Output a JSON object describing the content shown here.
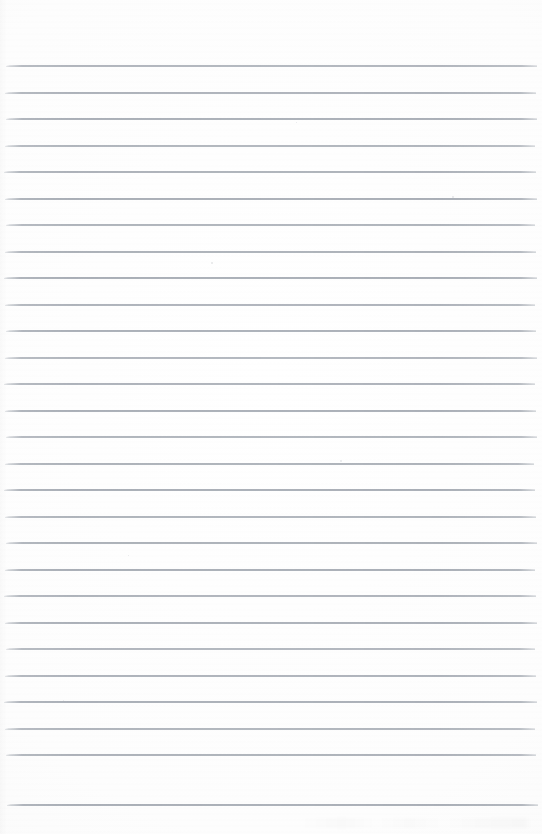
{
  "document": {
    "kind": "scanned-lined-notebook-page",
    "title": "Blank ruled notebook page",
    "page_width": 542,
    "page_height": 834,
    "content_text": "",
    "has_handwriting": false,
    "has_printed_text": false,
    "has_margin_line": false,
    "orientation": "portrait"
  },
  "colors": {
    "paper_background": "#fdfdfd",
    "page_edge": "#f7f7f8",
    "rule_line": "#a9aeb6",
    "rule_line_ghost": "#b0b5bd",
    "speck": "#969ba3"
  },
  "ruling": {
    "style": "wide-ruled horizontal lines",
    "line_count": 28,
    "first_line_y": 66,
    "line_spacing": 26.5,
    "line_thickness": 2,
    "line_start_x": 5,
    "line_end_x": 537,
    "top_margin": 66,
    "bottom_margin": 29,
    "lines_y": [
      66,
      92.5,
      119,
      145.5,
      172,
      198.5,
      225,
      251.5,
      278,
      304.5,
      331,
      357.5,
      384,
      410.5,
      437,
      463.5,
      490,
      516.5,
      543,
      569.5,
      596,
      622.5,
      649,
      675.5,
      702,
      728.5,
      755,
      805
    ],
    "lines_x_start": [
      6,
      5,
      6,
      5,
      4,
      5,
      6,
      5,
      4,
      5,
      6,
      5,
      4,
      5,
      6,
      5,
      4,
      5,
      6,
      5,
      4,
      5,
      6,
      5,
      4,
      5,
      6,
      7
    ],
    "lines_x_end": [
      537,
      536,
      537,
      535,
      536,
      537,
      535,
      536,
      537,
      535,
      536,
      537,
      535,
      536,
      537,
      534,
      535,
      536,
      537,
      535,
      536,
      537,
      535,
      536,
      537,
      535,
      536,
      538
    ]
  },
  "artifacts": {
    "specks": [
      {
        "x": 340,
        "y": 460,
        "size": 2.2
      },
      {
        "x": 211,
        "y": 262,
        "size": 1.6
      },
      {
        "x": 128,
        "y": 555,
        "size": 1.4
      },
      {
        "x": 452,
        "y": 196,
        "size": 1.5
      },
      {
        "x": 63,
        "y": 700,
        "size": 1.3
      },
      {
        "x": 296,
        "y": 122,
        "size": 1.4
      }
    ],
    "bottom_smudge": true,
    "left_edge_shade": true
  }
}
